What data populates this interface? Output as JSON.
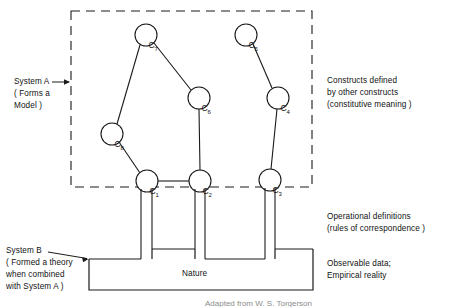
{
  "figure": {
    "background_color": "#ffffff",
    "line_color": "#1a1a1a"
  },
  "dashed_box": {
    "name": "system-a-boundary",
    "x": 71,
    "y": 11,
    "width": 241,
    "height": 176,
    "style": "dashed"
  },
  "nodes": [
    {
      "id": "C1",
      "label": "C",
      "sub": "1",
      "cx": 147,
      "cy": 181,
      "r": 11
    },
    {
      "id": "C2",
      "label": "C",
      "sub": "2",
      "cx": 200,
      "cy": 181,
      "r": 11
    },
    {
      "id": "C3",
      "label": "C",
      "sub": "3",
      "cx": 270,
      "cy": 180,
      "r": 11
    },
    {
      "id": "C4",
      "label": "C",
      "sub": "4",
      "cx": 278,
      "cy": 98,
      "r": 11
    },
    {
      "id": "C5",
      "label": "C",
      "sub": "5",
      "cx": 246,
      "cy": 35,
      "r": 11
    },
    {
      "id": "C6",
      "label": "C",
      "sub": "6",
      "cx": 199,
      "cy": 98,
      "r": 11
    },
    {
      "id": "C7",
      "label": "C",
      "sub": "7",
      "cx": 146,
      "cy": 35,
      "r": 11
    },
    {
      "id": "C8",
      "label": "C",
      "sub": "8",
      "cx": 112,
      "cy": 134,
      "r": 11
    }
  ],
  "edges": [
    {
      "from": "C7",
      "to": "C6"
    },
    {
      "from": "C7",
      "to": "C8"
    },
    {
      "from": "C8",
      "to": "C1"
    },
    {
      "from": "C6",
      "to": "C2"
    },
    {
      "from": "C1",
      "to": "C2"
    },
    {
      "from": "C5",
      "to": "C4"
    },
    {
      "from": "C4",
      "to": "C3"
    }
  ],
  "nature_box": {
    "name": "nature-box",
    "label": "Nature",
    "x": 89,
    "y": 259,
    "width": 224,
    "height": 31
  },
  "operational_links": [
    {
      "node": "C1",
      "left_x": 141,
      "right_x": 152
    },
    {
      "node": "C2",
      "left_x": 195,
      "right_x": 205
    },
    {
      "node": "C3",
      "left_x": 265,
      "right_x": 275
    }
  ],
  "labels": {
    "system_a": {
      "name": "system-a-label",
      "lines": [
        "System A",
        "( Forms a",
        "Model )"
      ],
      "line1": "System A",
      "line2": "( Forms a",
      "line3": "Model )"
    },
    "system_b": {
      "name": "system-b-label",
      "line1": "System B",
      "line2": "( Formed a theory",
      "line3": "when combined",
      "line4": "with System A )"
    },
    "constructs": {
      "name": "constructs-label",
      "line1": "Constructs defined",
      "line2": "by other constructs",
      "line3": "(constitutive meaning )"
    },
    "operational": {
      "name": "operational-definitions-label",
      "line1": "Operational definitions",
      "line2": "(rules of correspondence )"
    },
    "observable": {
      "name": "observable-data-label",
      "line1": "Observable data;",
      "line2": "Empirical reality"
    },
    "caption": {
      "name": "figure-caption",
      "text": "Adapted from W. S. Torgerson"
    }
  }
}
